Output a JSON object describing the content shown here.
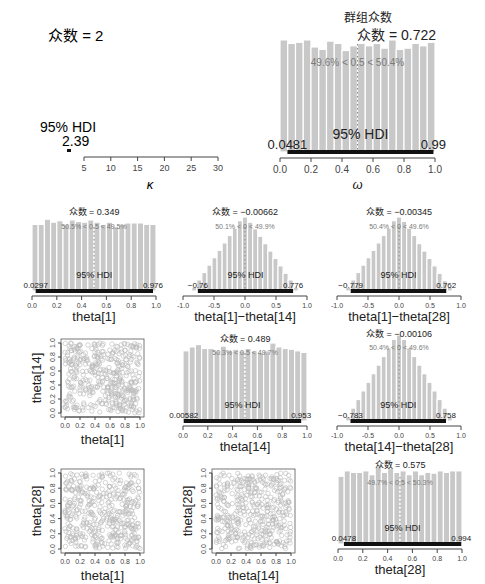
{
  "chart_data": [
    {
      "id": "kappa",
      "type": "histogram",
      "title": "",
      "xlabel": "κ",
      "xlim": [
        5,
        30
      ],
      "xticks": [
        5,
        10,
        15,
        20,
        25,
        30
      ],
      "mode_label": "众数 = 2",
      "hdi_label": "95% HDI",
      "hdi_low": "2",
      "hdi_high": "2.39",
      "hdi_range": [
        2,
        2.39
      ],
      "note": "posterior mass concentrated near 2, below axis start"
    },
    {
      "id": "omega",
      "type": "histogram",
      "title": "群组众数",
      "xlabel": "ω",
      "xlim": [
        0,
        1
      ],
      "xticks": [
        0.0,
        0.2,
        0.4,
        0.6,
        0.8,
        1.0
      ],
      "mode_label": "众数 = 0.722",
      "compare_label": "49.6% < 0.5 < 50.4%",
      "compare_value": 0.5,
      "hdi_label": "95% HDI",
      "hdi_low": "0.0481",
      "hdi_high": "0.99",
      "hdi_range": [
        0.0481,
        0.99
      ],
      "bars": [
        0.95,
        0.92,
        0.93,
        0.95,
        0.89,
        0.87,
        0.94,
        0.92,
        0.86,
        0.9,
        0.92,
        0.9,
        0.92,
        0.88,
        0.95,
        0.87,
        0.88,
        0.92,
        0.9,
        0.93
      ]
    },
    {
      "id": "theta1",
      "type": "histogram",
      "xlabel": "theta[1]",
      "xlim": [
        0,
        1
      ],
      "xticks": [
        0.0,
        0.2,
        0.4,
        0.6,
        0.8,
        1.0
      ],
      "mode_label": "众数 = 0.349",
      "compare_label": "50.5% < 0.5 < 49.5%",
      "compare_value": 0.5,
      "hdi_label": "95% HDI",
      "hdi_low": "0.0297",
      "hdi_high": "0.976",
      "hdi_range": [
        0.0297,
        0.976
      ],
      "bars": [
        0.9,
        0.9,
        0.97,
        0.93,
        0.95,
        0.9,
        0.96,
        0.94,
        0.93,
        0.96,
        0.93,
        0.9,
        0.93,
        0.87,
        0.9,
        0.92,
        0.92,
        0.92,
        0.9,
        0.9
      ]
    },
    {
      "id": "diff_1_14",
      "type": "histogram",
      "xlabel": "theta[1]−theta[14]",
      "xlim": [
        -1,
        1
      ],
      "xticks": [
        -1.0,
        -0.5,
        0.0,
        0.5,
        1.0
      ],
      "mode_label": "众数 = −0.00662",
      "compare_label": "50.1% < 0 < 49.9%",
      "compare_value": 0,
      "hdi_label": "95% HDI",
      "hdi_low": "−0.76",
      "hdi_high": "0.776",
      "hdi_range": [
        -0.76,
        0.776
      ],
      "bars": [
        0.05,
        0.15,
        0.25,
        0.35,
        0.45,
        0.55,
        0.65,
        0.75,
        0.85,
        0.95,
        1.0,
        0.93,
        0.84,
        0.74,
        0.64,
        0.54,
        0.44,
        0.34,
        0.24,
        0.15,
        0.05
      ]
    },
    {
      "id": "diff_1_28",
      "type": "histogram",
      "xlabel": "theta[1]−theta[28]",
      "xlim": [
        -1,
        1
      ],
      "xticks": [
        -1.0,
        -0.5,
        0.0,
        0.5,
        1.0
      ],
      "mode_label": "众数 = −0.00345",
      "compare_label": "50.4% < 0 < 49.6%",
      "compare_value": 0,
      "hdi_label": "95% HDI",
      "hdi_low": "−0.779",
      "hdi_high": "0.762",
      "hdi_range": [
        -0.779,
        0.762
      ],
      "bars": [
        0.05,
        0.15,
        0.25,
        0.35,
        0.45,
        0.55,
        0.65,
        0.75,
        0.85,
        0.95,
        1.0,
        0.94,
        0.85,
        0.75,
        0.64,
        0.54,
        0.44,
        0.34,
        0.24,
        0.14,
        0.05
      ]
    },
    {
      "id": "scatter_1_14",
      "type": "scatter",
      "xlabel": "theta[1]",
      "ylabel": "theta[14]",
      "xlim": [
        0,
        1
      ],
      "ylim": [
        0,
        1
      ],
      "xticks": [
        0.0,
        0.2,
        0.4,
        0.6,
        0.8,
        1.0
      ],
      "yticks": [
        0.0,
        0.2,
        0.4,
        0.6,
        0.8,
        1.0
      ],
      "note": "uniform cloud of ~500 open circles"
    },
    {
      "id": "theta14",
      "type": "histogram",
      "xlabel": "theta[14]",
      "xlim": [
        0,
        1
      ],
      "xticks": [
        0.0,
        0.2,
        0.4,
        0.6,
        0.8,
        1.0
      ],
      "mode_label": "众数 = 0.489",
      "compare_label": "50.3% < 0.5 < 49.7%",
      "compare_value": 0.5,
      "hdi_label": "95% HDI",
      "hdi_low": "0.00582",
      "hdi_high": "0.953",
      "hdi_range": [
        0.00582,
        0.953
      ],
      "bars": [
        0.9,
        0.95,
        0.98,
        0.93,
        0.93,
        0.9,
        0.96,
        0.9,
        0.92,
        0.9,
        0.93,
        0.9,
        0.88,
        0.9,
        1.0,
        0.95,
        0.93,
        0.92,
        0.9,
        0.88
      ]
    },
    {
      "id": "diff_14_28",
      "type": "histogram",
      "xlabel": "theta[14]−theta[28]",
      "xlim": [
        -1,
        1
      ],
      "xticks": [
        -1.0,
        -0.5,
        0.0,
        0.5,
        1.0
      ],
      "mode_label": "众数 = −0.00106",
      "compare_label": "50.4% < 0 < 49.6%",
      "compare_value": 0,
      "hdi_label": "95% HDI",
      "hdi_low": "−0.783",
      "hdi_high": "0.758",
      "hdi_range": [
        -0.783,
        0.758
      ],
      "bars": [
        0.05,
        0.15,
        0.25,
        0.35,
        0.45,
        0.55,
        0.65,
        0.75,
        0.85,
        0.95,
        1.0,
        0.95,
        0.85,
        0.75,
        0.65,
        0.55,
        0.45,
        0.35,
        0.25,
        0.15,
        0.05
      ]
    },
    {
      "id": "scatter_1_28",
      "type": "scatter",
      "xlabel": "theta[1]",
      "ylabel": "theta[28]",
      "xlim": [
        0,
        1
      ],
      "ylim": [
        0,
        1
      ],
      "xticks": [
        0.0,
        0.2,
        0.4,
        0.6,
        0.8,
        1.0
      ],
      "yticks": [
        0.0,
        0.2,
        0.4,
        0.6,
        0.8,
        1.0
      ],
      "note": "uniform cloud of ~500 open circles"
    },
    {
      "id": "scatter_14_28",
      "type": "scatter",
      "xlabel": "theta[14]",
      "ylabel": "theta[28]",
      "xlim": [
        0,
        1
      ],
      "ylim": [
        0,
        1
      ],
      "xticks": [
        0.0,
        0.2,
        0.4,
        0.6,
        0.8,
        1.0
      ],
      "yticks": [
        0.0,
        0.2,
        0.4,
        0.6,
        0.8,
        1.0
      ],
      "note": "uniform cloud of ~500 open circles"
    },
    {
      "id": "theta28",
      "type": "histogram",
      "xlabel": "theta[28]",
      "xlim": [
        0,
        1
      ],
      "xticks": [
        0.0,
        0.2,
        0.4,
        0.6,
        0.8,
        1.0
      ],
      "mode_label": "众数 = 0.575",
      "compare_label": "49.7% < 0.5 < 50.3%",
      "compare_value": 0.5,
      "hdi_label": "95% HDI",
      "hdi_low": "0.0478",
      "hdi_high": "0.994",
      "hdi_range": [
        0.0478,
        0.994
      ],
      "bars": [
        0.88,
        0.95,
        0.93,
        0.93,
        0.95,
        0.9,
        1.0,
        0.93,
        0.98,
        0.93,
        0.95,
        0.9,
        0.95,
        0.9,
        0.93,
        0.92,
        0.95,
        0.93,
        0.95,
        0.95
      ]
    }
  ],
  "colors": {
    "bar": "#c8c8c8",
    "bar_edge": "#ffffff",
    "hdi": "#111111",
    "compare_text": "#7a7a7a",
    "axis": "#444444",
    "scatter": "#b8b8b8"
  }
}
